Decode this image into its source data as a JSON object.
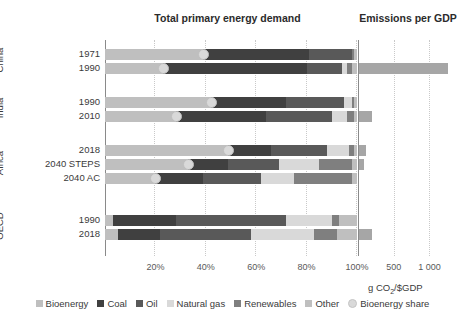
{
  "titles": {
    "left": "Total primary energy demand",
    "right": "Emissions per GDP"
  },
  "axis": {
    "x_ticks_left": [
      "20%",
      "40%",
      "60%",
      "80%",
      "100%"
    ],
    "x_ticks_right": [
      "500",
      "1 000"
    ],
    "right_unit": "g CO2/$GDP",
    "left_max": 100,
    "right_max": 1400
  },
  "groups": [
    {
      "name": "China",
      "rows": [
        0,
        1
      ]
    },
    {
      "name": "India",
      "rows": [
        2,
        3
      ]
    },
    {
      "name": "Africa",
      "rows": [
        4,
        5,
        6
      ]
    },
    {
      "name": "OECD",
      "rows": [
        7,
        8
      ]
    }
  ],
  "legend": [
    {
      "label": "Bioenergy",
      "color": "#bfbfbf",
      "shape": "square"
    },
    {
      "label": "Coal",
      "color": "#404040",
      "shape": "square"
    },
    {
      "label": "Oil",
      "color": "#595959",
      "shape": "square"
    },
    {
      "label": "Natural gas",
      "color": "#d9d9d9",
      "shape": "square"
    },
    {
      "label": "Renewables",
      "color": "#7f7f7f",
      "shape": "square"
    },
    {
      "label": "Other",
      "color": "#bfbfbf",
      "shape": "square"
    },
    {
      "label": "Bioenergy share",
      "color": "#d9d9d9",
      "shape": "circle"
    }
  ],
  "colors": {
    "bioenergy": "#bfbfbf",
    "coal": "#404040",
    "oil": "#595959",
    "natural_gas": "#d9d9d9",
    "renewables": "#7f7f7f",
    "other": "#bfbfbf",
    "dot": "#d9d9d9",
    "emissions_bar": "#a6a6a6"
  },
  "chart_data": {
    "type": "bar",
    "xlabel": "",
    "ylabel": "",
    "orientation": "horizontal",
    "stacked": true,
    "grid": true,
    "legend_position": "bottom",
    "categories": [
      "China 1971",
      "China 1990",
      "India 1990",
      "India 2010",
      "Africa 2018",
      "Africa 2040 STEPS",
      "Africa 2040 AC",
      "OECD 1990",
      "OECD 2018"
    ],
    "series": [
      {
        "name": "Bioenergy",
        "color": "#bfbfbf",
        "values": [
          39,
          23,
          42,
          28,
          49,
          33,
          20,
          3,
          5
        ]
      },
      {
        "name": "Coal",
        "color": "#404040",
        "values": [
          42,
          57,
          30,
          36,
          17,
          16,
          19,
          25,
          17
        ]
      },
      {
        "name": "Oil",
        "color": "#595959",
        "values": [
          17,
          14,
          23,
          26,
          22,
          20,
          23,
          44,
          36
        ]
      },
      {
        "name": "Natural gas",
        "color": "#d9d9d9",
        "values": [
          0,
          2,
          3,
          6,
          9,
          16,
          13,
          18,
          25
        ]
      },
      {
        "name": "Renewables",
        "color": "#7f7f7f",
        "values": [
          1,
          2,
          1,
          3,
          2,
          13,
          23,
          3,
          9
        ]
      },
      {
        "name": "Other",
        "color": "#bfbfbf",
        "values": [
          1,
          2,
          1,
          1,
          1,
          2,
          2,
          7,
          8
        ]
      }
    ],
    "bioenergy_share_points": {
      "name": "Bioenergy share",
      "marker": "circle",
      "color": "#d9d9d9",
      "values": [
        39,
        23,
        42,
        28,
        49,
        33,
        20,
        null,
        null
      ]
    },
    "emissions_per_gdp": {
      "name": "Emissions per GDP",
      "unit": "g CO2/$GDP",
      "color": "#a6a6a6",
      "xlim": [
        0,
        1400
      ],
      "ticks": [
        500,
        1000
      ],
      "values": [
        null,
        1240,
        null,
        180,
        95,
        70,
        null,
        null,
        175
      ]
    },
    "row_labels": [
      "1971",
      "1990",
      "1990",
      "2010",
      "2018",
      "2040 STEPS",
      "2040 AC",
      "1990",
      "2018"
    ]
  }
}
